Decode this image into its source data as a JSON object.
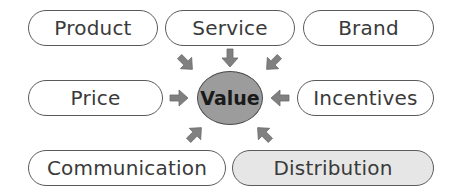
{
  "diagram": {
    "center": {
      "label": "Value",
      "fill": "#9c9c9c"
    },
    "nodes": [
      {
        "id": "product",
        "label": "Product"
      },
      {
        "id": "service",
        "label": "Service"
      },
      {
        "id": "brand",
        "label": "Brand"
      },
      {
        "id": "price",
        "label": "Price"
      },
      {
        "id": "incentives",
        "label": "Incentives"
      },
      {
        "id": "communication",
        "label": "Communication"
      },
      {
        "id": "distribution",
        "label": "Distribution",
        "highlighted": true,
        "fill": "#e6e6e6"
      }
    ],
    "arrows": [
      {
        "from": "product",
        "to": "value",
        "direction": "down-right"
      },
      {
        "from": "service",
        "to": "value",
        "direction": "down"
      },
      {
        "from": "brand",
        "to": "value",
        "direction": "down-left"
      },
      {
        "from": "price",
        "to": "value",
        "direction": "right"
      },
      {
        "from": "incentives",
        "to": "value",
        "direction": "left"
      },
      {
        "from": "communication",
        "to": "value",
        "direction": "up-right"
      },
      {
        "from": "distribution",
        "to": "value",
        "direction": "up-left"
      }
    ],
    "arrow_color": "#808080",
    "border_color": "#5a5a5a"
  }
}
